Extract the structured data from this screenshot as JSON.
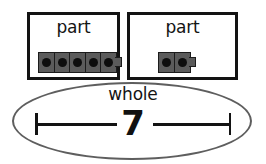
{
  "diagram": {
    "type": "part-part-whole",
    "colors": {
      "box_border": "#131313",
      "ellipse_border": "#5e5e5e",
      "cube_body": "#5b5b5b",
      "cube_hole": "#0d0d0d",
      "text": "#141414",
      "background": "#ffffff"
    },
    "parts": [
      {
        "label": "part",
        "cube_count": 5,
        "has_connector_nub": true
      },
      {
        "label": "part",
        "cube_count": 2,
        "has_connector_nub": true
      }
    ],
    "whole": {
      "label": "whole",
      "value": "7",
      "measure_left_cap": "tick",
      "measure_right_cap": "tick"
    }
  }
}
